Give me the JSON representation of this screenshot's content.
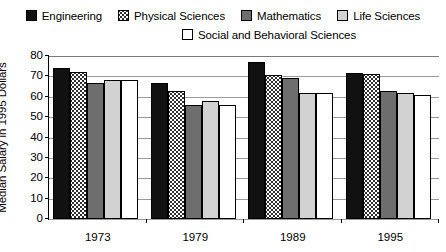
{
  "chart_data": {
    "type": "bar",
    "title": "",
    "xlabel": "",
    "ylabel": "Median Salary in 1995 Dollars",
    "ylim": [
      0,
      80
    ],
    "yticks": [
      0,
      10,
      20,
      30,
      40,
      50,
      60,
      70,
      80
    ],
    "grid": true,
    "legend_position": "top",
    "categories": [
      "1973",
      "1979",
      "1989",
      "1995"
    ],
    "series": [
      {
        "name": "Engineering",
        "swatch": "solid-black",
        "color": "#111111",
        "values": [
          74,
          67,
          77,
          71.5
        ]
      },
      {
        "name": "Physical Sciences",
        "swatch": "dotted",
        "color": "#ffffff",
        "values": [
          72,
          63,
          70.5,
          71
        ]
      },
      {
        "name": "Mathematics",
        "swatch": "solid-dark-gray",
        "color": "#6e6e6e",
        "values": [
          67,
          56,
          69,
          63
        ]
      },
      {
        "name": "Life Sciences",
        "swatch": "solid-light-gray",
        "color": "#d2d2d2",
        "values": [
          68,
          58,
          62,
          62
        ]
      },
      {
        "name": "Social and Behavioral Sciences",
        "swatch": "empty-white",
        "color": "#ffffff",
        "values": [
          68,
          56,
          62,
          61
        ]
      }
    ]
  },
  "legend": {
    "row1": [
      {
        "label": "Engineering"
      },
      {
        "label": "Physical Sciences"
      },
      {
        "label": "Mathematics"
      },
      {
        "label": "Life Sciences"
      }
    ],
    "row2": [
      {
        "label": "Social and Behavioral Sciences"
      }
    ]
  },
  "axis": {
    "y_title": "Median Salary in 1995 Dollars",
    "y_ticks": [
      "80",
      "70",
      "60",
      "50",
      "40",
      "30",
      "20",
      "10",
      "0"
    ],
    "x_ticks": [
      "1973",
      "1979",
      "1989",
      "1995"
    ]
  }
}
